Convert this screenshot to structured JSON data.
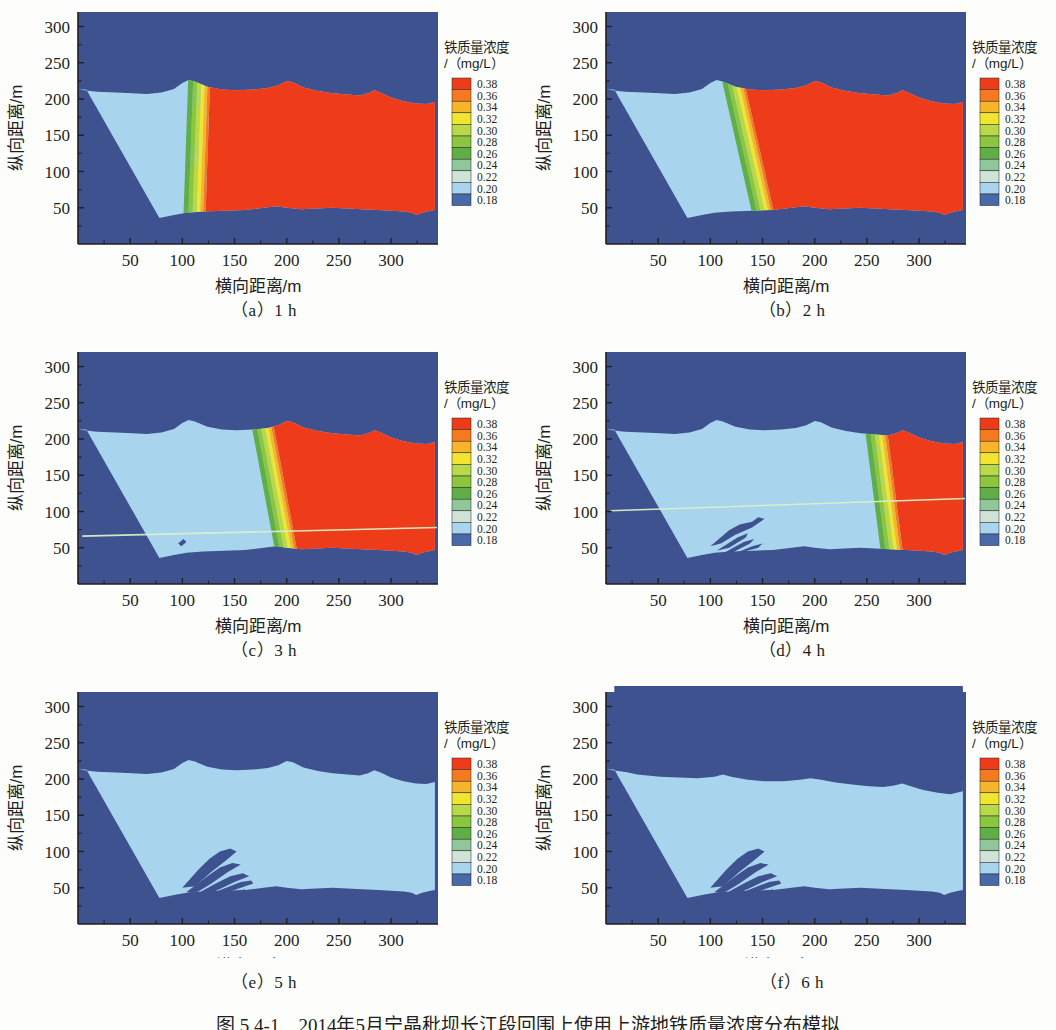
{
  "figure": {
    "caption": "图 5.4-1　2014年5月宁晶秕坝长江段回围上使用上游地铁质量浓度分布模拟",
    "panels": [
      {
        "id": "a",
        "label": "（a）1 h",
        "time_h": 1
      },
      {
        "id": "b",
        "label": "（b）2 h",
        "time_h": 2
      },
      {
        "id": "c",
        "label": "（c）3 h",
        "time_h": 3
      },
      {
        "id": "d",
        "label": "（d）4 h",
        "time_h": 4
      },
      {
        "id": "e",
        "label": "（e）5 h",
        "time_h": 5
      },
      {
        "id": "f",
        "label": "（f）6 h",
        "time_h": 6
      }
    ]
  },
  "chart_data": {
    "type": "heatmap",
    "title": "",
    "xlabel": "横向距离/m",
    "ylabel": "纵向距离/m",
    "xlim": [
      0,
      345
    ],
    "ylim": [
      0,
      320
    ],
    "xticks": [
      50,
      100,
      150,
      200,
      250,
      300
    ],
    "yticks": [
      50,
      100,
      150,
      200,
      250,
      300
    ],
    "xtick_labels": [
      "50",
      "100",
      "150",
      "200",
      "250",
      "300"
    ],
    "ytick_labels": [
      "50",
      "100",
      "150",
      "200",
      "250",
      "300"
    ],
    "grid": false,
    "colorbar": {
      "title_line1": "铁质量浓度",
      "title_line2": "/（mg/L）",
      "unit": "mg/L",
      "tick_labels": [
        "0.38",
        "0.36",
        "0.34",
        "0.32",
        "0.30",
        "0.28",
        "0.26",
        "0.24",
        "0.22",
        "0.20",
        "0.18"
      ],
      "values": [
        0.38,
        0.36,
        0.34,
        0.32,
        0.3,
        0.28,
        0.26,
        0.24,
        0.22,
        0.2,
        0.18
      ],
      "colors": [
        "#EE3B19",
        "#F47A20",
        "#F6B52A",
        "#F2E531",
        "#B9D94A",
        "#8CC63F",
        "#5FAE46",
        "#8FC79A",
        "#CFE3D8",
        "#A8D4EE",
        "#4A69A8"
      ],
      "background_color": "#3E528F",
      "n_bands": 11
    },
    "series": [
      {
        "name": "1 h",
        "panel": "a",
        "front_x_top": 108,
        "front_x_bottom": 100,
        "fill_fraction_high": 0.72,
        "high_value": 0.38,
        "low_value": 0.2,
        "description": "高浓度（红色，0.38 mg/L）区域占据河道大部分，低浓度淡蓝带沿左岸分布至横向距离约100 m"
      },
      {
        "name": "2 h",
        "panel": "b",
        "front_x_top": 95,
        "front_x_bottom": 148,
        "fill_fraction_high": 0.62,
        "high_value": 0.38,
        "low_value": 0.2,
        "description": "淡蓝低浓度区向右扩展至约150 m，红色高浓度区后退"
      },
      {
        "name": "3 h",
        "panel": "c",
        "front_x_top": 152,
        "front_x_bottom": 196,
        "fill_fraction_high": 0.44,
        "high_value": 0.38,
        "low_value": 0.2,
        "description": "锋面推进至约200 m，左下出现深色滩地斑块"
      },
      {
        "name": "4 h",
        "panel": "d",
        "front_x_top": 238,
        "front_x_bottom": 268,
        "fill_fraction_high": 0.23,
        "high_value": 0.38,
        "low_value": 0.2,
        "description": "锋面推进至约260 m，左下深色枝状滩地明显"
      },
      {
        "name": "5 h",
        "panel": "e",
        "front_x_top": 345,
        "front_x_bottom": 345,
        "fill_fraction_high": 0.0,
        "high_value": 0.2,
        "low_value": 0.2,
        "description": "高浓度区基本消失，全段为淡蓝低浓度（约0.20 mg/L）"
      },
      {
        "name": "6 h",
        "panel": "f",
        "front_x_top": 345,
        "front_x_bottom": 345,
        "fill_fraction_high": 0.0,
        "high_value": 0.2,
        "low_value": 0.2,
        "description": "淡蓝区自上边界收缩，深蓝背景扩大"
      }
    ]
  }
}
